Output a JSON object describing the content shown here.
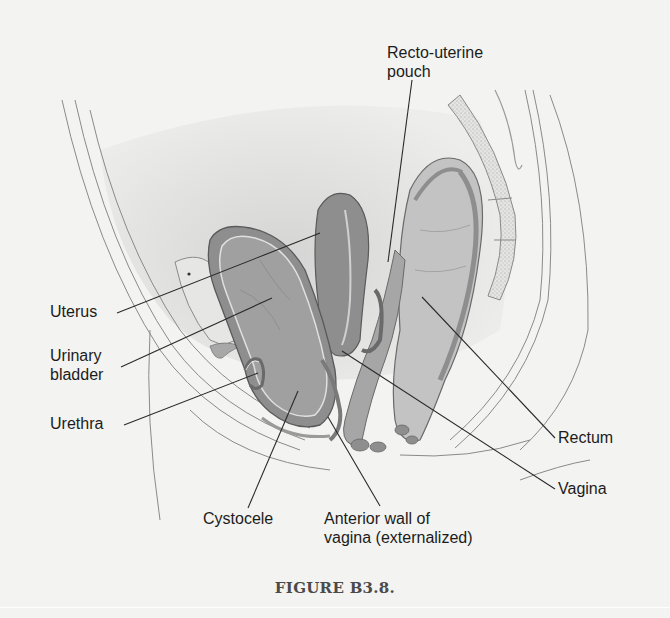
{
  "figure": {
    "caption": "FIGURE B3.8.",
    "colors": {
      "background": "#f3f3f1",
      "pelvic_cavity_shade": "#dcdcdc",
      "organ_dark": "#8e8e8e",
      "organ_mid": "#a6a6a6",
      "organ_light": "#c2c2c2",
      "outline": "#6a6a6a",
      "leader_line": "#2a2a2a",
      "label_text": "#1c1c1c"
    },
    "labels": [
      {
        "id": "recto-uterine-pouch",
        "text": "Recto-uterine\npouch",
        "x": 387,
        "y": 43,
        "line": [
          412,
          80,
          388,
          262
        ]
      },
      {
        "id": "uterus",
        "text": "Uterus",
        "x": 50,
        "y": 302,
        "line": [
          117,
          313,
          320,
          233
        ]
      },
      {
        "id": "urinary-bladder",
        "text": "Urinary\nbladder",
        "x": 50,
        "y": 346,
        "line": [
          121,
          367,
          272,
          298
        ]
      },
      {
        "id": "urethra",
        "text": "Urethra",
        "x": 50,
        "y": 414,
        "line": [
          124,
          425,
          258,
          373
        ]
      },
      {
        "id": "rectum",
        "text": "Rectum",
        "x": 558,
        "y": 428,
        "line": [
          555,
          438,
          422,
          297
        ]
      },
      {
        "id": "vagina",
        "text": "Vagina",
        "x": 558,
        "y": 479,
        "line": [
          555,
          489,
          342,
          351
        ]
      },
      {
        "id": "cystocele",
        "text": "Cystocele",
        "x": 203,
        "y": 509,
        "line": [
          248,
          508,
          298,
          391
        ]
      },
      {
        "id": "anterior-wall-of-vagina",
        "text": "Anterior wall of\nvagina (externalized)",
        "x": 324,
        "y": 509,
        "line": [
          380,
          506,
          328,
          417
        ]
      }
    ]
  }
}
